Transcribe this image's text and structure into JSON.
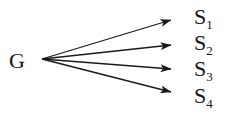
{
  "diagram": {
    "type": "fan-out-graph",
    "background_color": "#ffffff",
    "stroke_color": "#1a1a1a",
    "text_color": "#161616",
    "source": {
      "id": "G",
      "label": "G",
      "x": 18,
      "y": 59
    },
    "sinks": [
      {
        "id": "S1",
        "label": "S",
        "subscript": "1",
        "x": 204,
        "y": 17
      },
      {
        "id": "S2",
        "label": "S",
        "subscript": "2",
        "x": 204,
        "y": 44
      },
      {
        "id": "S3",
        "label": "S",
        "subscript": "3",
        "x": 204,
        "y": 70
      },
      {
        "id": "S4",
        "label": "S",
        "subscript": "4",
        "x": 204,
        "y": 96
      }
    ],
    "edges": [
      {
        "from": "G",
        "to": "S1",
        "x1": 42,
        "y1": 59,
        "x2": 181,
        "y2": 17
      },
      {
        "from": "G",
        "to": "S2",
        "x1": 42,
        "y1": 59,
        "x2": 181,
        "y2": 44
      },
      {
        "from": "G",
        "to": "S3",
        "x1": 42,
        "y1": 59,
        "x2": 181,
        "y2": 70
      },
      {
        "from": "G",
        "to": "S4",
        "x1": 42,
        "y1": 59,
        "x2": 181,
        "y2": 95
      }
    ],
    "arrowhead": {
      "shape": "solid-triangle",
      "length": 11,
      "width": 8
    },
    "line_width": 1.3
  }
}
